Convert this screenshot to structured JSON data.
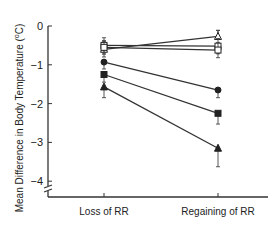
{
  "chart_data": {
    "type": "line",
    "title": "",
    "xlabel": "",
    "ylabel": "Mean Difference in Body Temperature (°C)",
    "ylabel_parts": {
      "main": "Mean Difference in Body Temperature (",
      "sup": "o",
      "unit": "C)"
    },
    "categories": [
      "Loss of RR",
      "Regaining of RR"
    ],
    "ylim": [
      -4.3,
      0
    ],
    "yticks": [
      0,
      -1,
      -2,
      -3,
      -4
    ],
    "ytick_labels": [
      "0",
      "−1",
      "−2",
      "−3",
      "−4"
    ],
    "axis_break": true,
    "grid": false,
    "legend": "none",
    "series": [
      {
        "name": "open triangle",
        "marker": "triangle-open",
        "values": [
          -0.6,
          -0.27
        ],
        "err": [
          0.12,
          0.08
        ]
      },
      {
        "name": "open square A",
        "marker": "square-open",
        "values": [
          -0.5,
          -0.52
        ],
        "err": [
          0.12,
          0.12
        ]
      },
      {
        "name": "open square B",
        "marker": "square-open",
        "values": [
          -0.55,
          -0.62
        ],
        "err": [
          0.1,
          0.12
        ]
      },
      {
        "name": "filled circle",
        "marker": "circle-filled",
        "values": [
          -0.93,
          -1.65
        ],
        "err": [
          0.1,
          0.12
        ]
      },
      {
        "name": "filled square",
        "marker": "square-filled",
        "values": [
          -1.25,
          -2.25
        ],
        "err": [
          0.12,
          0.2
        ]
      },
      {
        "name": "filled triangle",
        "marker": "triangle-filled",
        "values": [
          -1.57,
          -3.15
        ],
        "err": [
          0.2,
          0.4
        ]
      }
    ]
  }
}
